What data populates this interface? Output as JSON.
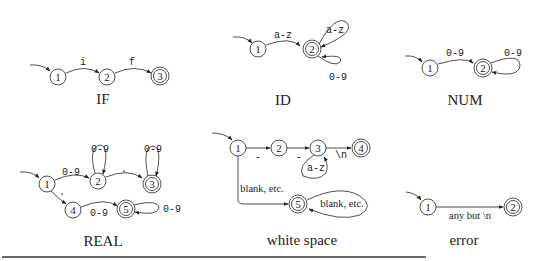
{
  "automata": [
    {
      "name": "IF",
      "states": [
        {
          "id": "1",
          "accepting": false
        },
        {
          "id": "2",
          "accepting": false
        },
        {
          "id": "3",
          "accepting": true
        }
      ],
      "start": "1",
      "transitions": [
        {
          "from": "1",
          "to": "2",
          "label": "i"
        },
        {
          "from": "2",
          "to": "3",
          "label": "f"
        }
      ]
    },
    {
      "name": "ID",
      "states": [
        {
          "id": "1",
          "accepting": false
        },
        {
          "id": "2",
          "accepting": true
        }
      ],
      "start": "1",
      "transitions": [
        {
          "from": "1",
          "to": "2",
          "label": "a-z"
        },
        {
          "from": "2",
          "to": "2",
          "label": "a-z"
        },
        {
          "from": "2",
          "to": "2",
          "label": "0-9"
        }
      ]
    },
    {
      "name": "NUM",
      "states": [
        {
          "id": "1",
          "accepting": false
        },
        {
          "id": "2",
          "accepting": true
        }
      ],
      "start": "1",
      "transitions": [
        {
          "from": "1",
          "to": "2",
          "label": "0-9"
        },
        {
          "from": "2",
          "to": "2",
          "label": "0-9"
        }
      ]
    },
    {
      "name": "REAL",
      "states": [
        {
          "id": "1",
          "accepting": false
        },
        {
          "id": "2",
          "accepting": false
        },
        {
          "id": "3",
          "accepting": true
        },
        {
          "id": "4",
          "accepting": false
        },
        {
          "id": "5",
          "accepting": true
        }
      ],
      "start": "1",
      "transitions": [
        {
          "from": "1",
          "to": "2",
          "label": "0-9"
        },
        {
          "from": "2",
          "to": "2",
          "label": "0-9"
        },
        {
          "from": "2",
          "to": "3",
          "label": "."
        },
        {
          "from": "3",
          "to": "3",
          "label": "0-9"
        },
        {
          "from": "1",
          "to": "4",
          "label": "."
        },
        {
          "from": "4",
          "to": "5",
          "label": "0-9"
        },
        {
          "from": "5",
          "to": "5",
          "label": "0-9"
        }
      ]
    },
    {
      "name": "white space",
      "states": [
        {
          "id": "1",
          "accepting": false
        },
        {
          "id": "2",
          "accepting": false
        },
        {
          "id": "3",
          "accepting": false
        },
        {
          "id": "4",
          "accepting": true
        },
        {
          "id": "5",
          "accepting": true
        }
      ],
      "start": "1",
      "transitions": [
        {
          "from": "1",
          "to": "2",
          "label": "-"
        },
        {
          "from": "2",
          "to": "3",
          "label": "-"
        },
        {
          "from": "3",
          "to": "3",
          "label": "a-z"
        },
        {
          "from": "3",
          "to": "4",
          "label": "\\n"
        },
        {
          "from": "1",
          "to": "5",
          "label": "blank, etc."
        },
        {
          "from": "5",
          "to": "5",
          "label": "blank, etc."
        }
      ]
    },
    {
      "name": "error",
      "states": [
        {
          "id": "1",
          "accepting": false
        },
        {
          "id": "2",
          "accepting": true
        }
      ],
      "start": "1",
      "transitions": [
        {
          "from": "1",
          "to": "2",
          "label": "any but \\n"
        }
      ]
    }
  ]
}
